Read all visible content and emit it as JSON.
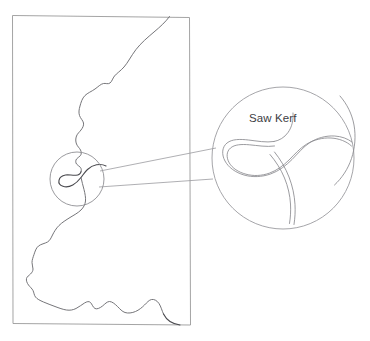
{
  "figure": {
    "background_color": "#ffffff",
    "line_color": "#6e6e72",
    "outline_color": "#9a9a9a",
    "label_color": "#404044"
  },
  "annotations": {
    "kerf_label": "Saw Kerf"
  },
  "stock": {
    "name": "workpiece-rectangle",
    "corners": {
      "top_left": [
        12,
        15
      ],
      "top_right": [
        189,
        17
      ],
      "bottom_right": [
        190,
        325
      ],
      "bottom_left": [
        13,
        324
      ]
    }
  },
  "detail_callout": {
    "source_circle": {
      "cx": 77,
      "cy": 179,
      "r": 27
    },
    "target_circle": {
      "cx": 283,
      "cy": 158,
      "r": 71
    },
    "leader_upper": [
      [
        99,
        172
      ],
      [
        215,
        149
      ]
    ],
    "leader_lower": [
      [
        99,
        186
      ],
      [
        213,
        178
      ]
    ]
  },
  "cut_path": {
    "description": "bandsaw cut line entering top edge, looping at kerf, exiting bottom right edge"
  }
}
